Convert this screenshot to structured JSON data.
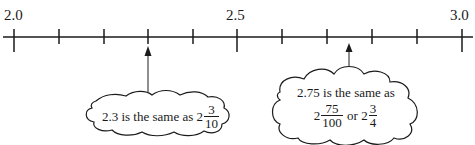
{
  "number_line": {
    "min": 2.0,
    "max": 3.0,
    "step": 0.1,
    "labels": [
      {
        "value": 2.0,
        "text": "2.0"
      },
      {
        "value": 2.5,
        "text": "2.5"
      },
      {
        "value": 3.0,
        "text": "3.0"
      }
    ]
  },
  "callouts": [
    {
      "points_to": 2.3,
      "text": "2.3 is the same as",
      "whole": "2",
      "numerator": "3",
      "denominator": "10"
    },
    {
      "points_to": 2.75,
      "line1": "2.75 is the same as",
      "frac1": {
        "whole": "2",
        "numerator": "75",
        "denominator": "100"
      },
      "connector": "or",
      "frac2": {
        "whole": "2",
        "numerator": "3",
        "denominator": "4"
      }
    }
  ],
  "colors": {
    "ink": "#1a1a1a",
    "background": "#ffffff"
  }
}
